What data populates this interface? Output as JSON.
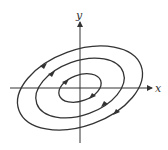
{
  "diagram": {
    "type": "phase-portrait",
    "axes": {
      "x_label": "x",
      "y_label": "y"
    },
    "orbits": [
      {
        "name": "inner",
        "rx": 22,
        "ry": 13,
        "direction": "clockwise"
      },
      {
        "name": "middle",
        "rx": 46,
        "ry": 27,
        "direction": "clockwise"
      },
      {
        "name": "outer",
        "rx": 65,
        "ry": 38,
        "direction": "clockwise"
      }
    ],
    "tilt_degrees": -20,
    "stroke_color": "#333333"
  }
}
